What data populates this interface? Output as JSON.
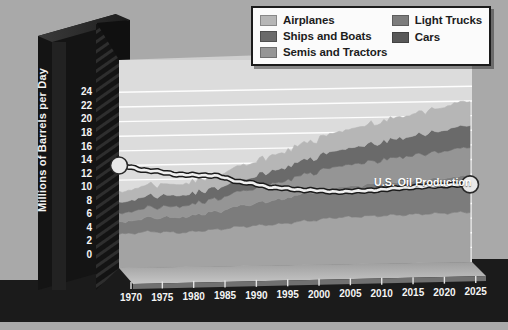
{
  "chart_data": {
    "type": "area",
    "stacked": true,
    "title": "",
    "xlabel": "",
    "ylabel": "Millions of Barrels per Day",
    "xlim": [
      1970,
      2026
    ],
    "ylim": [
      0,
      25
    ],
    "yticks": [
      0,
      2,
      4,
      6,
      8,
      10,
      12,
      14,
      16,
      18,
      20,
      22,
      24
    ],
    "xticks": [
      1970,
      1975,
      1980,
      1985,
      1990,
      1995,
      2000,
      2005,
      2010,
      2015,
      2020,
      2025
    ],
    "grid": true,
    "legend_position": "top-right",
    "x": [
      1970,
      1975,
      1980,
      1985,
      1990,
      1995,
      2000,
      2005,
      2010,
      2015,
      2020,
      2025
    ],
    "series": [
      {
        "name": "Cars",
        "color": "#a3a3a3",
        "values": [
          4.6,
          4.9,
          4.7,
          5.0,
          5.4,
          5.6,
          6.0,
          6.4,
          6.5,
          6.6,
          6.7,
          6.8
        ]
      },
      {
        "name": "Light Trucks",
        "color": "#7c7c7c",
        "values": [
          1.6,
          1.9,
          2.1,
          2.4,
          2.9,
          3.3,
          3.8,
          4.1,
          4.3,
          4.5,
          4.7,
          4.9
        ]
      },
      {
        "name": "Semis and Tractors",
        "color": "#959595",
        "values": [
          1.2,
          1.4,
          1.5,
          1.7,
          2.0,
          2.3,
          2.6,
          2.9,
          3.1,
          3.4,
          3.6,
          3.9
        ]
      },
      {
        "name": "Ships and Boats",
        "color": "#6a6a6a",
        "values": [
          1.5,
          1.6,
          1.5,
          1.5,
          1.6,
          1.8,
          2.0,
          2.2,
          2.4,
          2.6,
          2.8,
          3.0
        ]
      },
      {
        "name": "Airplanes",
        "color": "#b6b6b6",
        "values": [
          1.4,
          1.5,
          1.5,
          1.7,
          1.9,
          2.1,
          2.3,
          2.5,
          2.7,
          2.9,
          3.1,
          3.3
        ]
      }
    ],
    "annotations": [
      {
        "name": "U.S. Oil Production",
        "label": "U.S. Oil Production",
        "color": "#f0f0f0",
        "values": [
          14.0,
          13.2,
          12.6,
          12.4,
          11.4,
          10.6,
          10.2,
          9.9,
          10.0,
          10.3,
          10.5,
          10.6
        ]
      }
    ],
    "colors": {
      "background": "#a9a9a9",
      "plot_wall": "#dcdcdc",
      "axis_block": "#1a1a1a",
      "gridline": "#ffffff",
      "tick_text": "#f4f4f4"
    }
  },
  "legend": {
    "items": [
      {
        "label": "Airplanes",
        "color": "#b6b6b6",
        "column": "left"
      },
      {
        "label": "Ships and Boats",
        "color": "#6a6a6a",
        "column": "left"
      },
      {
        "label": "Semis and Tractors",
        "color": "#959595",
        "column": "left"
      },
      {
        "label": "Light Trucks",
        "color": "#7c7c7c",
        "column": "right"
      },
      {
        "label": "Cars",
        "color": "#585858",
        "column": "right"
      }
    ]
  },
  "axis": {
    "y_title": "Millions of Barrels per Day",
    "y_ticks": [
      "24",
      "22",
      "20",
      "18",
      "16",
      "14",
      "12",
      "10",
      "8",
      "6",
      "4",
      "2",
      "0"
    ],
    "x_ticks": [
      "1970",
      "1975",
      "1980",
      "1985",
      "1990",
      "1995",
      "2000",
      "2005",
      "2010",
      "2015",
      "2020",
      "2025"
    ]
  },
  "series_label": {
    "oil_production": "U.S. Oil Production"
  }
}
